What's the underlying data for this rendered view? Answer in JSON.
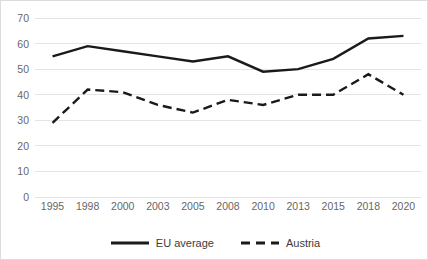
{
  "chart_data": {
    "type": "line",
    "title": "",
    "subtitle": "",
    "xlabel": "",
    "ylabel": "",
    "categories": [
      "1995",
      "1998",
      "2000",
      "2003",
      "2005",
      "2008",
      "2010",
      "2013",
      "2015",
      "2018",
      "2020"
    ],
    "ylim": [
      0,
      70
    ],
    "y_ticks": [
      "0",
      "10",
      "20",
      "30",
      "40",
      "50",
      "60",
      "70"
    ],
    "y_tick_values": [
      0,
      10,
      20,
      30,
      40,
      50,
      60,
      70
    ],
    "grid": "horizontal",
    "legend_position": "bottom",
    "series": [
      {
        "name": "EU average",
        "style": "solid",
        "color": "#1a1a1a",
        "values": [
          55,
          59,
          57,
          55,
          53,
          55,
          49,
          50,
          54,
          62,
          63
        ]
      },
      {
        "name": "Austria",
        "style": "dashed",
        "color": "#1a1a1a",
        "values": [
          29,
          42,
          41,
          36,
          33,
          38,
          36,
          40,
          40,
          48,
          40
        ]
      }
    ]
  },
  "legend": {
    "items": [
      {
        "label": "EU average",
        "style": "solid"
      },
      {
        "label": "Austria",
        "style": "dashed"
      }
    ]
  },
  "colors": {
    "series_line": "#1a1a1a",
    "grid_line": "#e4e4e4",
    "axis_text": "#676767",
    "figure_border": "#dcdcdc",
    "background": "#ffffff"
  }
}
